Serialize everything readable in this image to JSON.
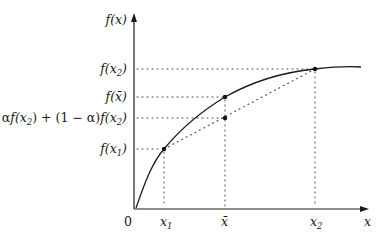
{
  "diagram": {
    "type": "concave-function-illustration",
    "y_axis_label": "f(x)",
    "x_axis_label": "x",
    "origin_label": "0",
    "x_ticks": [
      {
        "id": "x1",
        "base": "x",
        "sub": "1",
        "px": 164
      },
      {
        "id": "xbar",
        "base": "x̄",
        "sub": "",
        "px": 225
      },
      {
        "id": "x2",
        "base": "x",
        "sub": "2",
        "px": 315
      }
    ],
    "y_labels": [
      {
        "id": "fx2",
        "text": "f(x₂)",
        "py": 69
      },
      {
        "id": "fxbar",
        "text": "f(x̄)",
        "py": 97
      },
      {
        "id": "combo",
        "text": "αf(x₂) + (1 − α)f(x₂)",
        "py": 118
      },
      {
        "id": "fx1",
        "text": "f(x₁)",
        "py": 149
      }
    ],
    "points": [
      {
        "id": "p-x1",
        "x": 164,
        "y": 149,
        "on": "curve"
      },
      {
        "id": "p-xbar",
        "x": 225,
        "y": 97,
        "on": "curve"
      },
      {
        "id": "p-chord",
        "x": 225,
        "y": 118,
        "on": "chord"
      },
      {
        "id": "p-x2",
        "x": 315,
        "y": 69,
        "on": "curve"
      }
    ],
    "colors": {
      "ink": "#1a1a1a",
      "background": "#ffffff"
    }
  }
}
